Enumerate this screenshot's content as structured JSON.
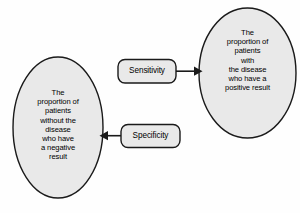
{
  "diagram": {
    "type": "flow-diagram",
    "background_color": "#fefefe",
    "node_fill_color": "#e9e9e9",
    "node_stroke_color": "#1a1a1a",
    "text_color": "#000000",
    "nodes": [
      {
        "id": "ellipse-positive",
        "shape": "ellipse",
        "label": "The\nproportion of\npatients\nwith\nthe disease\nwho have a\npositive result",
        "lines": [
          "The",
          "proportion of",
          "patients",
          "with",
          "the disease",
          "who have a",
          "positive result"
        ]
      },
      {
        "id": "ellipse-negative",
        "shape": "ellipse",
        "label": "The\nproportion of\npatients\nwithout the\ndisease\nwho have\na negative\nresult",
        "lines": [
          "The",
          "proportion of",
          "patients",
          "without the",
          "disease",
          "who have",
          "a negative",
          "result"
        ]
      },
      {
        "id": "box-sensitivity",
        "shape": "rounded-rectangle",
        "label": "Sensitivity"
      },
      {
        "id": "box-specificity",
        "shape": "rounded-rectangle",
        "label": "Specificity"
      }
    ],
    "edges": [
      {
        "id": "edge-sensitivity",
        "from": "box-sensitivity",
        "to": "ellipse-positive",
        "direction": "right",
        "arrowhead": "filled-triangle"
      },
      {
        "id": "edge-specificity",
        "from": "box-specificity",
        "to": "ellipse-negative",
        "direction": "left",
        "arrowhead": "filled-triangle"
      }
    ],
    "caption_fragment": ""
  }
}
